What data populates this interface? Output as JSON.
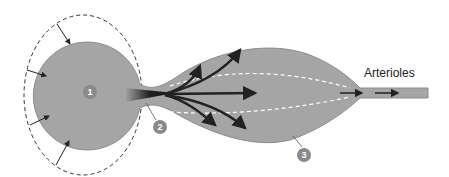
{
  "labels": {
    "arterioles": "Arterioles"
  },
  "markers": [
    {
      "id": "1",
      "label": "1"
    },
    {
      "id": "2",
      "label": "2"
    },
    {
      "id": "3",
      "label": "3"
    }
  ],
  "colors": {
    "fill": "#a5a5a5",
    "stroke": "#8c8c8c",
    "arrow": "#2a2a2a",
    "badge": "#8a8a8a",
    "dash_white": "#ffffff",
    "dash_dark": "#333333"
  }
}
